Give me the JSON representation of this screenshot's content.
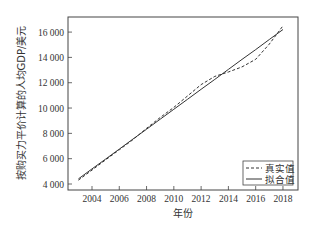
{
  "chart_data": {
    "type": "line",
    "title": "",
    "xlabel": "年份",
    "ylabel": "按购买力平价计算的人均GDP/美元",
    "x": [
      2003,
      2004,
      2005,
      2006,
      2007,
      2008,
      2009,
      2010,
      2011,
      2012,
      2013,
      2014,
      2015,
      2016,
      2017,
      2018
    ],
    "series": [
      {
        "name": "真实值",
        "style": "dashed",
        "values": [
          4300,
          5100,
          5900,
          6700,
          7500,
          8400,
          9250,
          10050,
          10950,
          11850,
          12500,
          12850,
          13250,
          13850,
          15050,
          16500
        ]
      },
      {
        "name": "拟合值",
        "style": "solid",
        "values": [
          4400,
          5190,
          5970,
          6760,
          7550,
          8330,
          9120,
          9900,
          10690,
          11480,
          12260,
          13050,
          13840,
          14620,
          15410,
          16200
        ]
      }
    ],
    "xticks": [
      "2004",
      "2006",
      "2008",
      "2010",
      "2012",
      "2014",
      "2016",
      "2018"
    ],
    "yticks": [
      "4 000",
      "6 000",
      "8 000",
      "10 000",
      "12 000",
      "14 000",
      "16 000"
    ],
    "xlim": [
      2002.2,
      2018.8
    ],
    "ylim": [
      3500,
      17200
    ],
    "grid": false,
    "legend_position": "lower right"
  },
  "legend": {
    "items": [
      {
        "label": "真实值",
        "style": "dashed"
      },
      {
        "label": "拟合值",
        "style": "solid"
      }
    ]
  },
  "colors": {
    "line": "#333333",
    "axis": "#444444"
  }
}
